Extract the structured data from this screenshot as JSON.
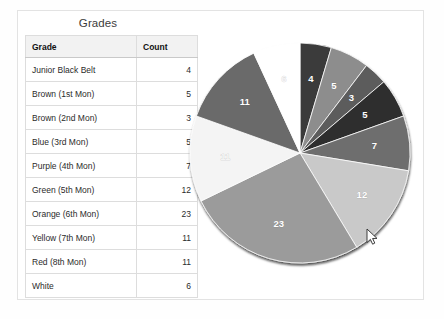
{
  "page": {
    "background": "#ffffff",
    "card_border": "#e3e3e3"
  },
  "table": {
    "title": "Grades",
    "columns": [
      "Grade",
      "Count"
    ],
    "rows": [
      {
        "grade": "Junior Black Belt",
        "count": "4"
      },
      {
        "grade": "Brown (1st Mon)",
        "count": "5"
      },
      {
        "grade": "Brown (2nd Mon)",
        "count": "3"
      },
      {
        "grade": "Blue (3rd Mon)",
        "count": "5"
      },
      {
        "grade": "Purple (4th Mon)",
        "count": "7"
      },
      {
        "grade": "Green (5th Mon)",
        "count": "12"
      },
      {
        "grade": "Orange (6th Mon)",
        "count": "23"
      },
      {
        "grade": "Yellow (7th Mon)",
        "count": "11"
      },
      {
        "grade": "Red (8th Mon)",
        "count": "11"
      },
      {
        "grade": "White",
        "count": "6"
      }
    ]
  },
  "chart_data": {
    "type": "pie",
    "title": "",
    "start_angle_deg": 0,
    "direction": "clockwise",
    "grid": false,
    "legend": "none",
    "data_labels": "value-inside-slice",
    "total": 87,
    "categories": [
      "Junior Black Belt",
      "Brown (1st Mon)",
      "Brown (2nd Mon)",
      "Blue (3rd Mon)",
      "Purple (4th Mon)",
      "Green (5th Mon)",
      "Orange (6th Mon)",
      "Yellow (7th Mon)",
      "Red (8th Mon)",
      "White"
    ],
    "values": [
      4,
      5,
      3,
      5,
      7,
      12,
      23,
      11,
      11,
      6
    ],
    "labels": [
      "4",
      "5",
      "3",
      "5",
      "7",
      "12",
      "23",
      "11",
      "11",
      "6"
    ],
    "colors": [
      "#3a3a3a",
      "#8d8d8d",
      "#5c5c5c",
      "#2f2f2f",
      "#6e6e6e",
      "#c9c9c9",
      "#9b9b9b",
      "#f4f4f4",
      "#6a6a6a",
      "#ffffff"
    ],
    "label_on_light": [
      false,
      false,
      false,
      false,
      false,
      false,
      false,
      true,
      false,
      true
    ]
  },
  "cursor": {
    "name": "mouse-pointer",
    "x": 367,
    "y": 229
  }
}
